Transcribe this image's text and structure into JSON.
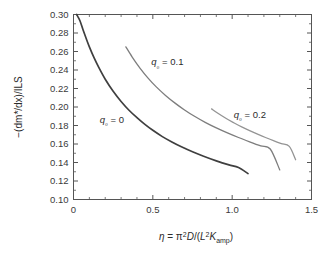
{
  "chart_data": {
    "type": "line",
    "title": "",
    "subtitle": "",
    "xlabel": "η = π²D/(L²K_amp)",
    "ylabel": "−(dm*/dx)/ILS",
    "xlim": [
      0,
      1.5
    ],
    "ylim": [
      0.1,
      0.3
    ],
    "grid": false,
    "legend_position": "inline-annotations",
    "x_ticks": [
      0,
      0.5,
      1.0,
      1.5
    ],
    "x_tick_labels": [
      "0",
      "0.5",
      "1.0",
      "1.5"
    ],
    "x_minor_tick_step": 0.1,
    "y_ticks": [
      0.1,
      0.12,
      0.14,
      0.16,
      0.18,
      0.2,
      0.22,
      0.24,
      0.26,
      0.28,
      0.3
    ],
    "y_tick_labels": [
      "0.10",
      "0.12",
      "0.14",
      "0.16",
      "0.18",
      "0.20",
      "0.22",
      "0.24",
      "0.26",
      "0.28",
      "0.30"
    ],
    "y_minor_tick_step": 0.01,
    "series": [
      {
        "name": "q0 = 0",
        "label": "q₀ = 0",
        "color": "#3f3f3f",
        "width": 1.7,
        "x": [
          0.02,
          0.04,
          0.06,
          0.08,
          0.1,
          0.13,
          0.16,
          0.2,
          0.25,
          0.3,
          0.35,
          0.4,
          0.45,
          0.5,
          0.56,
          0.62,
          0.68,
          0.75,
          0.82,
          0.9,
          0.98,
          1.04,
          1.1
        ],
        "y": [
          0.3,
          0.2935,
          0.2835,
          0.274,
          0.265,
          0.253,
          0.2425,
          0.23,
          0.217,
          0.206,
          0.1965,
          0.1885,
          0.1812,
          0.1748,
          0.168,
          0.1622,
          0.157,
          0.1516,
          0.1468,
          0.1418,
          0.1374,
          0.1345,
          0.128
        ]
      },
      {
        "name": "q0 = 0.1",
        "label": "q₀ = 0.1",
        "color": "#7d7d7d",
        "width": 1.3,
        "x": [
          0.33,
          0.37,
          0.42,
          0.47,
          0.52,
          0.58,
          0.64,
          0.7,
          0.76,
          0.83,
          0.9,
          0.97,
          1.04,
          1.11,
          1.18,
          1.24,
          1.3
        ],
        "y": [
          0.265,
          0.254,
          0.2418,
          0.2312,
          0.222,
          0.2125,
          0.2042,
          0.1968,
          0.1902,
          0.1834,
          0.1774,
          0.172,
          0.167,
          0.1624,
          0.158,
          0.1546,
          0.132
        ]
      },
      {
        "name": "q0 = 0.2",
        "label": "q₀ = 0.2",
        "color": "#949494",
        "width": 1.3,
        "x": [
          0.87,
          0.91,
          0.96,
          1.01,
          1.06,
          1.11,
          1.16,
          1.21,
          1.26,
          1.31,
          1.36,
          1.4
        ],
        "y": [
          0.198,
          0.1932,
          0.1878,
          0.183,
          0.1785,
          0.1744,
          0.1706,
          0.167,
          0.1636,
          0.1604,
          0.1574,
          0.143
        ]
      }
    ],
    "annotations": [
      {
        "text": "q₀ = 0",
        "x": 0.165,
        "y": 0.183
      },
      {
        "text": "q₀ = 0.1",
        "x": 0.49,
        "y": 0.245
      },
      {
        "text": "q₀ = 0.2",
        "x": 1.01,
        "y": 0.188
      }
    ]
  },
  "axis": {
    "y_title_parts": {
      "minus": "−(dm",
      "star": "*",
      "mid": "/dx)/ILS"
    },
    "x_title_parts": {
      "eta": "η",
      "eq": " = ",
      "pi": "π",
      "two_a": "2",
      "d": "D",
      "slash": "/(",
      "l": "L",
      "two_b": "2",
      "k": "K",
      "amp": "amp",
      "close": ")"
    }
  }
}
